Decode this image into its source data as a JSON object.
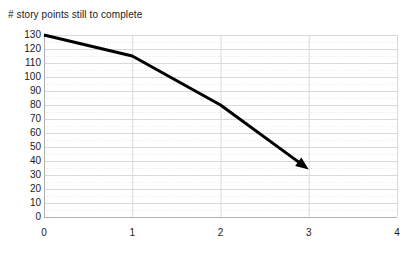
{
  "chart_data": {
    "type": "line",
    "title": "# story points still to complete",
    "xlabel": "",
    "ylabel": "",
    "xlim": [
      0,
      4
    ],
    "ylim": [
      0,
      130
    ],
    "grid": true,
    "legend": "none",
    "x_ticks": [
      "0",
      "1",
      "2",
      "3",
      "4"
    ],
    "y_ticks": [
      "0",
      "10",
      "20",
      "30",
      "40",
      "50",
      "60",
      "70",
      "80",
      "90",
      "100",
      "110",
      "120",
      "130"
    ],
    "x_tick_values": [
      0,
      1,
      2,
      3,
      4
    ],
    "y_tick_values": [
      0,
      10,
      20,
      30,
      40,
      50,
      60,
      70,
      80,
      90,
      100,
      110,
      120,
      130
    ],
    "series": [
      {
        "name": "burndown",
        "color": "#000000",
        "line_width": 3,
        "arrow_end": true,
        "x": [
          0,
          1,
          2,
          3
        ],
        "y": [
          130,
          115,
          80,
          34
        ]
      }
    ],
    "annotations": []
  },
  "style": {
    "background": "#ffffff",
    "axis_color": "#b0b0b0",
    "grid_major_color": "#d9d9d9",
    "grid_minor_color": "#e6e6e6",
    "text_color": "#1a1a1a",
    "line_color": "#000000"
  },
  "geometry": {
    "plot_left": 44,
    "plot_right": 397,
    "plot_top": 35,
    "plot_bottom": 217
  }
}
